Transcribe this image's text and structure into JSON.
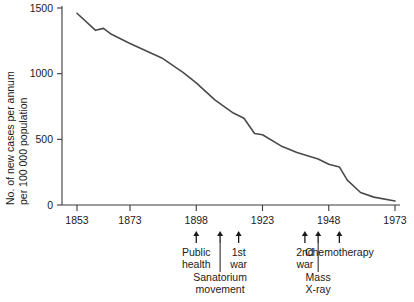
{
  "chart_data": {
    "type": "line",
    "title": "",
    "xlabel": "",
    "ylabel_line1": "No. of new cases per annum",
    "ylabel_line2": "per 100 000 population",
    "xlim": [
      1853,
      1973
    ],
    "ylim": [
      0,
      1500
    ],
    "grid": false,
    "legend": "none",
    "xticks": [
      1853,
      1873,
      1898,
      1923,
      1948,
      1973
    ],
    "xticklabels": [
      "1853",
      "1873",
      "1898",
      "1923",
      "1948",
      "1973"
    ],
    "yticks": [
      0,
      500,
      1000,
      1500
    ],
    "yticklabels": [
      "0",
      "500",
      "1000",
      "1500"
    ],
    "series": [
      {
        "name": "Tuberculosis notification rate",
        "x": [
          1853,
          1860,
          1863,
          1866,
          1873,
          1885,
          1893,
          1898,
          1905,
          1912,
          1916,
          1920,
          1923,
          1930,
          1936,
          1940,
          1944,
          1948,
          1952,
          1955,
          1960,
          1965,
          1973
        ],
        "values": [
          1460,
          1330,
          1345,
          1300,
          1230,
          1120,
          1010,
          930,
          800,
          700,
          660,
          545,
          535,
          450,
          400,
          375,
          350,
          310,
          290,
          190,
          95,
          60,
          30
        ]
      }
    ],
    "annotations": [
      {
        "label_line1": "Public",
        "label_line2": "health",
        "x": 1898,
        "row": 1,
        "stem": false
      },
      {
        "label_line1": "Sanatorium",
        "label_line2": "movement",
        "x": 1907,
        "row": 2,
        "stem": true
      },
      {
        "label_line1": "1st",
        "label_line2": "war",
        "x": 1914,
        "row": 1,
        "stem": false
      },
      {
        "label_line1": "2nd",
        "label_line2": "war",
        "x": 1939,
        "row": 1,
        "stem": false
      },
      {
        "label_line1": "Mass",
        "label_line2": "X-ray",
        "x": 1944,
        "row": 2,
        "stem": true
      },
      {
        "label_line1": "Chemotherapy",
        "label_line2": "",
        "x": 1952,
        "row": 1,
        "stem": false
      }
    ]
  },
  "colors": {
    "line": "#4a4a4a",
    "axis": "#3a3a3a",
    "text": "#1a1a1a",
    "background": "#ffffff"
  }
}
